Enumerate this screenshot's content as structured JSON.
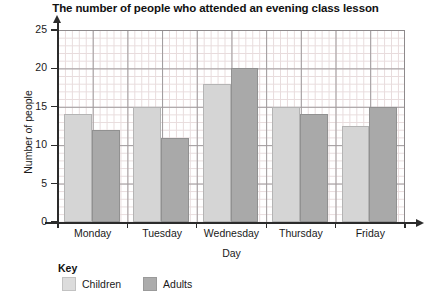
{
  "chart_data": {
    "type": "bar",
    "title": "The number of people who attended an evening class lesson",
    "xlabel": "Day",
    "ylabel": "Number of people",
    "categories": [
      "Monday",
      "Tuesday",
      "Wednesday",
      "Thursday",
      "Friday"
    ],
    "series": [
      {
        "name": "Children",
        "color": "#d5d5d5",
        "values": [
          14,
          15,
          18,
          15,
          12.5
        ]
      },
      {
        "name": "Adults",
        "color": "#a9a9a9",
        "values": [
          12,
          11,
          20,
          14,
          15
        ]
      }
    ],
    "ylim": [
      0,
      25
    ],
    "ytick_labels": [
      "0",
      "5",
      "10",
      "15",
      "20",
      "25"
    ],
    "ytick_values": [
      0,
      5,
      10,
      15,
      20,
      25
    ],
    "grid": true,
    "grid_minor_step": 1,
    "grid_major_step": 5,
    "legend_position": "bottom-left"
  },
  "legend": {
    "title": "Key"
  }
}
